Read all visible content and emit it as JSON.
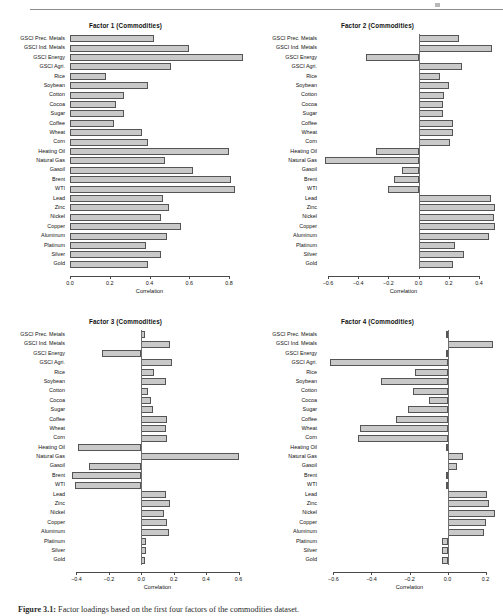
{
  "figure": {
    "caption_label": "Figure 3.1:",
    "caption_text": "Factor loadings based on the first four factors of the commodities dataset.",
    "axis_title": "Correlation",
    "bar_fill": "#c9c9c9",
    "bar_stroke": "#555555"
  },
  "categories": [
    "GSCI Prec. Metals",
    "GSCI Ind. Metals",
    "GSCI Energy",
    "GSCI Agri.",
    "Rice",
    "Soybean",
    "Cotton",
    "Cocoa",
    "Sugar",
    "Coffee",
    "Wheat",
    "Corn",
    "Heating Oil",
    "Natural Gas",
    "Gasoil",
    "Brent",
    "WTI",
    "Lead",
    "Zinc",
    "Nickel",
    "Copper",
    "Aluminum",
    "Platinum",
    "Silver",
    "Gold"
  ],
  "chart_data": [
    {
      "type": "bar",
      "title": "Factor 1 (Commodities)",
      "xlabel": "Correlation",
      "ylabel": "",
      "orientation": "horizontal",
      "xlim": [
        0.0,
        0.88
      ],
      "ticks": [
        0.0,
        0.2,
        0.4,
        0.6,
        0.8
      ],
      "ticklabels": [
        "0.0",
        "0.2",
        "0.4",
        "0.6",
        "0.8"
      ],
      "grid": false,
      "categories": [
        "GSCI Prec. Metals",
        "GSCI Ind. Metals",
        "GSCI Energy",
        "GSCI Agri.",
        "Rice",
        "Soybean",
        "Cotton",
        "Cocoa",
        "Sugar",
        "Coffee",
        "Wheat",
        "Corn",
        "Heating Oil",
        "Natural Gas",
        "Gasoil",
        "Brent",
        "WTI",
        "Lead",
        "Zinc",
        "Nickel",
        "Copper",
        "Aluminum",
        "Platinum",
        "Silver",
        "Gold"
      ],
      "values": [
        0.42,
        0.6,
        0.87,
        0.51,
        0.18,
        0.39,
        0.27,
        0.23,
        0.27,
        0.22,
        0.36,
        0.39,
        0.8,
        0.48,
        0.62,
        0.81,
        0.83,
        0.47,
        0.5,
        0.46,
        0.56,
        0.49,
        0.38,
        0.46,
        0.39
      ]
    },
    {
      "type": "bar",
      "title": "Factor 2 (Commodities)",
      "xlabel": "Correlation",
      "ylabel": "",
      "orientation": "horizontal",
      "xlim": [
        -0.64,
        0.52
      ],
      "ticks": [
        -0.6,
        -0.4,
        -0.2,
        0.0,
        0.2,
        0.4
      ],
      "ticklabels": [
        "-0.6",
        "-0.4",
        "-0.2",
        "0.0",
        "0.2",
        "0.4"
      ],
      "grid": false,
      "categories": [
        "GSCI Prec. Metals",
        "GSCI Ind. Metals",
        "GSCI Energy",
        "GSCI Agri.",
        "Rice",
        "Soybean",
        "Cotton",
        "Cocoa",
        "Sugar",
        "Coffee",
        "Wheat",
        "Corn",
        "Heating Oil",
        "Natural Gas",
        "Gasoil",
        "Brent",
        "WTI",
        "Lead",
        "Zinc",
        "Nickel",
        "Copper",
        "Aluminum",
        "Platinum",
        "Silver",
        "Gold"
      ],
      "values": [
        0.27,
        0.49,
        -0.35,
        0.29,
        0.14,
        0.2,
        0.17,
        0.16,
        0.16,
        0.23,
        0.23,
        0.21,
        -0.28,
        -0.62,
        -0.11,
        -0.16,
        -0.2,
        0.48,
        0.51,
        0.5,
        0.51,
        0.47,
        0.24,
        0.3,
        0.23
      ]
    },
    {
      "type": "bar",
      "title": "Factor 3 (Commodities)",
      "xlabel": "Correlation",
      "ylabel": "",
      "orientation": "horizontal",
      "xlim": [
        -0.44,
        0.64
      ],
      "ticks": [
        -0.4,
        -0.2,
        0.0,
        0.2,
        0.4,
        0.6
      ],
      "ticklabels": [
        "-0.4",
        "-0.2",
        "0.0",
        "0.2",
        "0.4",
        "0.6"
      ],
      "grid": false,
      "categories": [
        "GSCI Prec. Metals",
        "GSCI Ind. Metals",
        "GSCI Energy",
        "GSCI Agri.",
        "Rice",
        "Soybean",
        "Cotton",
        "Cocoa",
        "Sugar",
        "Coffee",
        "Wheat",
        "Corn",
        "Heating Oil",
        "Natural Gas",
        "Gasoil",
        "Brent",
        "WTI",
        "Lead",
        "Zinc",
        "Nickel",
        "Copper",
        "Aluminum",
        "Platinum",
        "Silver",
        "Gold"
      ],
      "values": [
        0.02,
        0.18,
        -0.24,
        0.19,
        0.08,
        0.15,
        0.04,
        0.06,
        0.07,
        0.16,
        0.15,
        0.16,
        -0.39,
        0.6,
        -0.32,
        -0.43,
        -0.41,
        0.15,
        0.18,
        0.14,
        0.16,
        0.17,
        0.03,
        0.03,
        0.02
      ]
    },
    {
      "type": "bar",
      "title": "Factor 4 (Commodities)",
      "xlabel": "Correlation",
      "ylabel": "",
      "orientation": "horizontal",
      "xlim": [
        -0.66,
        0.26
      ],
      "ticks": [
        -0.6,
        -0.4,
        -0.2,
        0.0,
        0.2
      ],
      "ticklabels": [
        "-0.6",
        "-0.4",
        "-0.2",
        "0.0",
        "0.2"
      ],
      "grid": false,
      "categories": [
        "GSCI Prec. Metals",
        "GSCI Ind. Metals",
        "GSCI Energy",
        "GSCI Agri.",
        "Rice",
        "Soybean",
        "Cotton",
        "Cocoa",
        "Sugar",
        "Coffee",
        "Wheat",
        "Corn",
        "Heating Oil",
        "Natural Gas",
        "Gasoil",
        "Brent",
        "WTI",
        "Lead",
        "Zinc",
        "Nickel",
        "Copper",
        "Aluminum",
        "Platinum",
        "Silver",
        "Gold"
      ],
      "values": [
        -0.01,
        0.24,
        -0.01,
        -0.62,
        -0.17,
        -0.35,
        -0.18,
        -0.1,
        -0.21,
        -0.27,
        -0.46,
        -0.47,
        -0.01,
        0.08,
        0.05,
        -0.01,
        -0.01,
        0.21,
        0.22,
        0.25,
        0.2,
        0.19,
        -0.03,
        -0.03,
        -0.03
      ]
    }
  ]
}
